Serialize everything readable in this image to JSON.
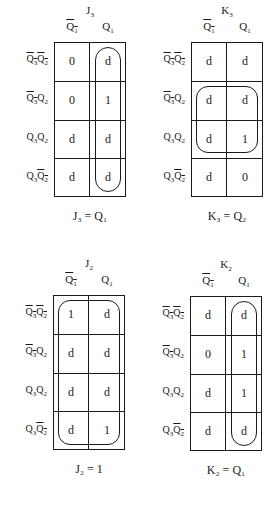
{
  "maps": [
    {
      "id": "J3",
      "title": {
        "base": "J",
        "sub": "3"
      },
      "col_headers": [
        {
          "base": "Q",
          "sub": "1",
          "bar": true
        },
        {
          "base": "Q",
          "sub": "1",
          "bar": false
        }
      ],
      "row_headers": [
        [
          {
            "base": "Q",
            "sub": "3",
            "bar": true
          },
          {
            "base": "Q",
            "sub": "2",
            "bar": true
          }
        ],
        [
          {
            "base": "Q",
            "sub": "3",
            "bar": true
          },
          {
            "base": "Q",
            "sub": "2",
            "bar": false
          }
        ],
        [
          {
            "base": "Q",
            "sub": "3",
            "bar": false
          },
          {
            "base": "Q",
            "sub": "2",
            "bar": false
          }
        ],
        [
          {
            "base": "Q",
            "sub": "3",
            "bar": false
          },
          {
            "base": "Q",
            "sub": "2",
            "bar": true
          }
        ]
      ],
      "cells": [
        [
          "0",
          "d"
        ],
        [
          "0",
          "1"
        ],
        [
          "d",
          "d"
        ],
        [
          "d",
          "d"
        ]
      ],
      "loop": {
        "col_start": 1,
        "col_end": 1,
        "row_start": 0,
        "row_end": 3,
        "shape": "vertical-pill"
      },
      "equation": "J₃ = Q₁"
    },
    {
      "id": "K3",
      "title": {
        "base": "K",
        "sub": "3"
      },
      "col_headers": [
        {
          "base": "Q",
          "sub": "1",
          "bar": true
        },
        {
          "base": "Q",
          "sub": "1",
          "bar": false
        }
      ],
      "row_headers": [
        [
          {
            "base": "Q",
            "sub": "3",
            "bar": true
          },
          {
            "base": "Q",
            "sub": "2",
            "bar": true
          }
        ],
        [
          {
            "base": "Q",
            "sub": "3",
            "bar": true
          },
          {
            "base": "Q",
            "sub": "2",
            "bar": false
          }
        ],
        [
          {
            "base": "Q",
            "sub": "3",
            "bar": false
          },
          {
            "base": "Q",
            "sub": "2",
            "bar": false
          }
        ],
        [
          {
            "base": "Q",
            "sub": "3",
            "bar": false
          },
          {
            "base": "Q",
            "sub": "2",
            "bar": true
          }
        ]
      ],
      "cells": [
        [
          "d",
          "d"
        ],
        [
          "d",
          "d"
        ],
        [
          "d",
          "1"
        ],
        [
          "d",
          "0"
        ]
      ],
      "loop": {
        "col_start": 0,
        "col_end": 1,
        "row_start": 1,
        "row_end": 2,
        "shape": "rounded-rect"
      },
      "equation": "K₃ = Q₂"
    },
    {
      "id": "J2",
      "title": {
        "base": "J",
        "sub": "2"
      },
      "col_headers": [
        {
          "base": "Q",
          "sub": "1",
          "bar": true
        },
        {
          "base": "Q",
          "sub": "1",
          "bar": false
        }
      ],
      "row_headers": [
        [
          {
            "base": "Q",
            "sub": "3",
            "bar": true
          },
          {
            "base": "Q",
            "sub": "2",
            "bar": true
          }
        ],
        [
          {
            "base": "Q",
            "sub": "3",
            "bar": true
          },
          {
            "base": "Q",
            "sub": "2",
            "bar": false
          }
        ],
        [
          {
            "base": "Q",
            "sub": "3",
            "bar": false
          },
          {
            "base": "Q",
            "sub": "2",
            "bar": false
          }
        ],
        [
          {
            "base": "Q",
            "sub": "3",
            "bar": false
          },
          {
            "base": "Q",
            "sub": "2",
            "bar": true
          }
        ]
      ],
      "cells": [
        [
          "1",
          "d"
        ],
        [
          "d",
          "d"
        ],
        [
          "d",
          "d"
        ],
        [
          "d",
          "1"
        ]
      ],
      "loop": {
        "col_start": 0,
        "col_end": 1,
        "row_start": 0,
        "row_end": 3,
        "shape": "rounded-rect"
      },
      "equation": "J₂ = 1"
    },
    {
      "id": "K2",
      "title": {
        "base": "K",
        "sub": "2"
      },
      "col_headers": [
        {
          "base": "Q",
          "sub": "1",
          "bar": true
        },
        {
          "base": "Q",
          "sub": "1",
          "bar": false
        }
      ],
      "row_headers": [
        [
          {
            "base": "Q",
            "sub": "3",
            "bar": true
          },
          {
            "base": "Q",
            "sub": "2",
            "bar": true
          }
        ],
        [
          {
            "base": "Q",
            "sub": "3",
            "bar": true
          },
          {
            "base": "Q",
            "sub": "2",
            "bar": false
          }
        ],
        [
          {
            "base": "Q",
            "sub": "3",
            "bar": false
          },
          {
            "base": "Q",
            "sub": "2",
            "bar": false
          }
        ],
        [
          {
            "base": "Q",
            "sub": "3",
            "bar": false
          },
          {
            "base": "Q",
            "sub": "2",
            "bar": true
          }
        ]
      ],
      "cells": [
        [
          "d",
          "d"
        ],
        [
          "0",
          "1"
        ],
        [
          "d",
          "1"
        ],
        [
          "d",
          "d"
        ]
      ],
      "loop": {
        "col_start": 1,
        "col_end": 1,
        "row_start": 0,
        "row_end": 3,
        "shape": "vertical-pill"
      },
      "equation": "K₂ = Q₁"
    }
  ],
  "layout": {
    "positions": [
      {
        "left": 54,
        "top": 42
      },
      {
        "left": 191,
        "top": 42
      },
      {
        "left": 53,
        "top": 295
      },
      {
        "left": 190,
        "top": 296
      }
    ],
    "cell_w": 36,
    "cell_h": 38.75
  }
}
